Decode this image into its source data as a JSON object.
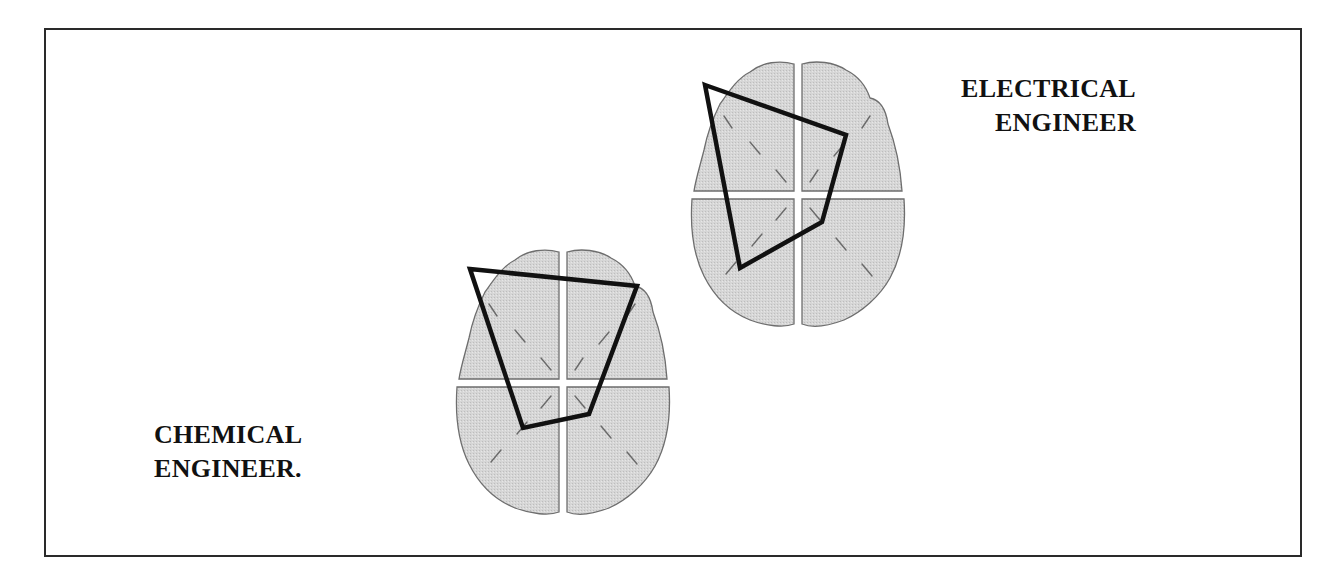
{
  "figure": {
    "frame": {
      "border_color": "#2a2a2a"
    },
    "brain_fill": "#d9d9d9",
    "brain_outline": "#6e6e6e",
    "polygon_color": "#111111",
    "subjects": [
      {
        "id": "electrical",
        "label_line1": "ELECTRICAL",
        "label_line2": "ENGINEER",
        "polygon": [
          [
            705,
            85
          ],
          [
            846,
            135
          ],
          [
            822,
            222
          ],
          [
            740,
            268
          ]
        ]
      },
      {
        "id": "chemical",
        "label_line1": "CHEMICAL",
        "label_line2": "ENGINEER.",
        "polygon": [
          [
            470,
            269
          ],
          [
            637,
            286
          ],
          [
            589,
            414
          ],
          [
            523,
            428
          ]
        ]
      }
    ]
  }
}
